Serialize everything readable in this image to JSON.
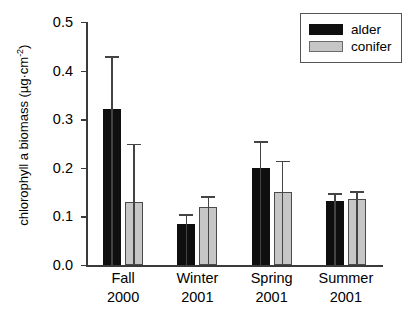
{
  "chart_data": {
    "type": "bar",
    "title": "",
    "xlabel": "",
    "ylabel": "chlorophyll a biomass (µg·cm",
    "ylabel_sup": "-2",
    "ylabel_tail": ")",
    "ylim": [
      0.0,
      0.5
    ],
    "grid": false,
    "legend_position": "top-right",
    "categories": [
      "Fall\n2000",
      "Winter\n2001",
      "Spring\n2001",
      "Summer\n2001"
    ],
    "category_lines": [
      {
        "season": "Fall",
        "year": "2000"
      },
      {
        "season": "Winter",
        "year": "2001"
      },
      {
        "season": "Spring",
        "year": "2001"
      },
      {
        "season": "Summer",
        "year": "2001"
      }
    ],
    "ytick_labels": [
      "0.0",
      "0.1",
      "0.2",
      "0.3",
      "0.4",
      "0.5"
    ],
    "ytick_values": [
      0.0,
      0.1,
      0.2,
      0.3,
      0.4,
      0.5
    ],
    "series": [
      {
        "name": "alder",
        "color": "#100f10",
        "values": [
          0.32,
          0.085,
          0.2,
          0.132
        ],
        "error_upper": [
          0.43,
          0.105,
          0.255,
          0.148
        ]
      },
      {
        "name": "conifer",
        "color": "#c6c6c6",
        "values": [
          0.13,
          0.12,
          0.15,
          0.135
        ],
        "error_upper": [
          0.25,
          0.142,
          0.215,
          0.152
        ]
      }
    ]
  },
  "legend": {
    "items": [
      {
        "label": "alder"
      },
      {
        "label": "conifer"
      }
    ]
  }
}
